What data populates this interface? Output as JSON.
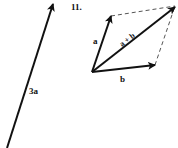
{
  "problem_number": "11.",
  "vectors": {
    "three_a": {
      "label": "3a",
      "from": [
        7,
        148
      ],
      "to": [
        53,
        3
      ]
    },
    "a": {
      "label": "a",
      "from": [
        92,
        72
      ],
      "to": [
        111,
        16
      ]
    },
    "b": {
      "label": "b",
      "from": [
        92,
        72
      ],
      "to": [
        155,
        65
      ]
    },
    "sum": {
      "label": "a + b",
      "from": [
        92,
        72
      ],
      "to": [
        175,
        7
      ]
    }
  },
  "dashed_edges": [
    {
      "from": [
        111,
        16
      ],
      "to": [
        175,
        7
      ]
    },
    {
      "from": [
        155,
        65
      ],
      "to": [
        175,
        7
      ]
    }
  ],
  "colors": {
    "ink": "#111111",
    "dash": "#555555"
  }
}
